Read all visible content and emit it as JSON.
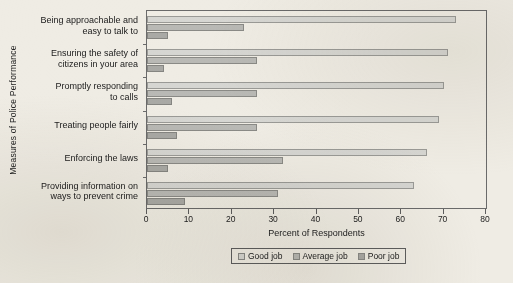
{
  "chart_data": {
    "type": "bar",
    "orientation": "horizontal",
    "title": "",
    "xlabel": "Percent of Respondents",
    "ylabel": "Measures of Police Performance",
    "xlim": [
      0,
      80
    ],
    "xticks": [
      0,
      10,
      20,
      30,
      40,
      50,
      60,
      70,
      80
    ],
    "grid": false,
    "legend_position": "bottom",
    "categories": [
      "Being approachable and easy to talk to",
      "Ensuring the safety of citizens in your area",
      "Promptly responding to calls",
      "Treating people fairly",
      "Enforcing the laws",
      "Providing information on ways to prevent crime"
    ],
    "category_lines": [
      [
        "Being approachable and",
        "easy to talk to"
      ],
      [
        "Ensuring the safety of",
        "citizens in your area"
      ],
      [
        "Promptly responding",
        "to calls"
      ],
      [
        "Treating people fairly"
      ],
      [
        "Enforcing the laws"
      ],
      [
        "Providing information on",
        "ways to prevent crime"
      ]
    ],
    "series": [
      {
        "name": "Good job",
        "color": "#d6d6d2",
        "values": [
          73,
          71,
          70,
          69,
          66,
          63
        ]
      },
      {
        "name": "Average job",
        "color": "#b9b9b5",
        "values": [
          23,
          26,
          26,
          26,
          32,
          31
        ]
      },
      {
        "name": "Poor job",
        "color": "#a9a9a5",
        "values": [
          5,
          4,
          6,
          7,
          5,
          9
        ]
      }
    ]
  },
  "axis": {
    "y_title": "Measures of Police Performance",
    "x_title": "Percent of Respondents",
    "x_tick_labels": [
      "0",
      "10",
      "20",
      "30",
      "40",
      "50",
      "60",
      "70",
      "80"
    ]
  },
  "legend": {
    "items": [
      {
        "label": "Good job",
        "swatch": "good"
      },
      {
        "label": "Average job",
        "swatch": "average"
      },
      {
        "label": "Poor job",
        "swatch": "poor"
      }
    ]
  },
  "colors": {
    "background": "#efece4",
    "frame": "#6a6a6a",
    "good": "#d6d6d2",
    "average": "#b9b9b5",
    "poor": "#a9a9a5"
  }
}
